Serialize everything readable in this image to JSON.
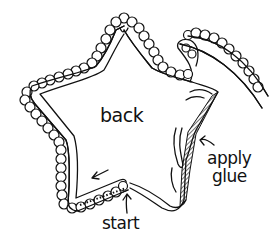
{
  "illustration": {
    "subject": "star-shaped piece with beaded trim being glued around its edge",
    "labels": {
      "back": "back",
      "apply": "apply",
      "glue": "glue",
      "start": "start"
    },
    "caption": "",
    "colors": {
      "ink": "#111111",
      "paper": "#ffffff"
    }
  }
}
